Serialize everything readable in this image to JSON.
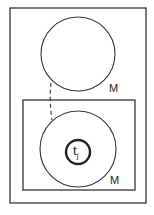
{
  "diagram": {
    "outer_frame": {
      "x": 10,
      "y": 8,
      "w": 136,
      "h": 195
    },
    "inner_frame": {
      "x": 23,
      "y": 100,
      "w": 112,
      "h": 90
    },
    "upper_circle": {
      "cx": 78,
      "cy": 54,
      "r": 37,
      "label": "M"
    },
    "lower_circle": {
      "cx": 78,
      "cy": 149,
      "r": 38,
      "label": "M"
    },
    "core_circle": {
      "cx": 78,
      "cy": 152,
      "r": 12,
      "label_main": "t",
      "label_sub": "j"
    },
    "connector": {
      "style": "dashed",
      "from": "upper_circle",
      "to": "lower_circle"
    },
    "colors": {
      "stroke": "#2a2a2a",
      "background": "#ffffff"
    }
  }
}
